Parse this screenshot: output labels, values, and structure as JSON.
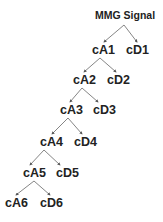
{
  "diagram": {
    "root": {
      "label": "MMG Signal",
      "x": 95,
      "y": 10
    },
    "levels": [
      {
        "a": {
          "label": "cA1",
          "x": 92,
          "y": 44
        },
        "d": {
          "label": "cD1",
          "x": 126,
          "y": 44
        }
      },
      {
        "a": {
          "label": "cA2",
          "x": 73,
          "y": 74
        },
        "d": {
          "label": "cD2",
          "x": 107,
          "y": 74
        }
      },
      {
        "a": {
          "label": "cA3",
          "x": 60,
          "y": 104
        },
        "d": {
          "label": "cD3",
          "x": 93,
          "y": 104
        }
      },
      {
        "a": {
          "label": "cA4",
          "x": 40,
          "y": 136
        },
        "d": {
          "label": "cD4",
          "x": 74,
          "y": 136
        }
      },
      {
        "a": {
          "label": "cA5",
          "x": 23,
          "y": 167
        },
        "d": {
          "label": "cD5",
          "x": 56,
          "y": 167
        }
      },
      {
        "a": {
          "label": "cA6",
          "x": 5,
          "y": 197
        },
        "d": {
          "label": "cD6",
          "x": 40,
          "y": 197
        }
      }
    ],
    "colors": {
      "text": "#222222",
      "edge": "#555555"
    }
  }
}
